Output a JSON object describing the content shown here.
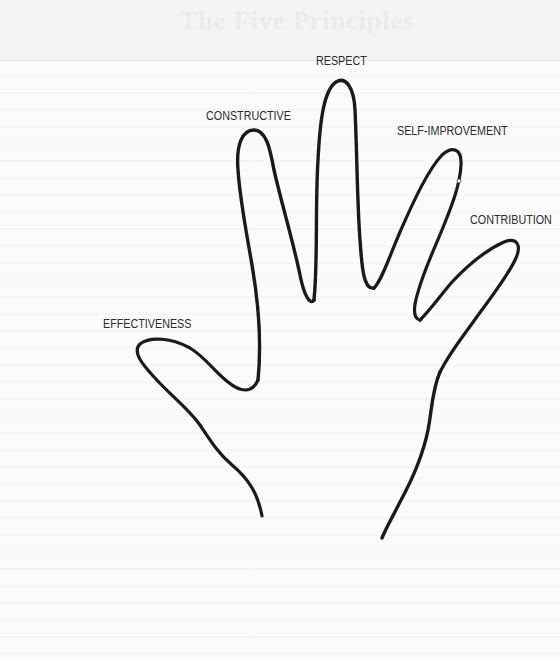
{
  "figure": {
    "type": "hand-outline-diagram",
    "header_ghost_text": "The Five Principles",
    "labels": {
      "thumb": "EFFECTIVENESS",
      "index": "CONSTRUCTIVE",
      "middle": "RESPECT",
      "ring": "SELF-IMPROVEMENT",
      "pinky": "CONTRIBUTION"
    },
    "colors": {
      "stroke": "#1a1a1a",
      "background": "#fbfbfb",
      "label": "#2a2a2a"
    }
  }
}
